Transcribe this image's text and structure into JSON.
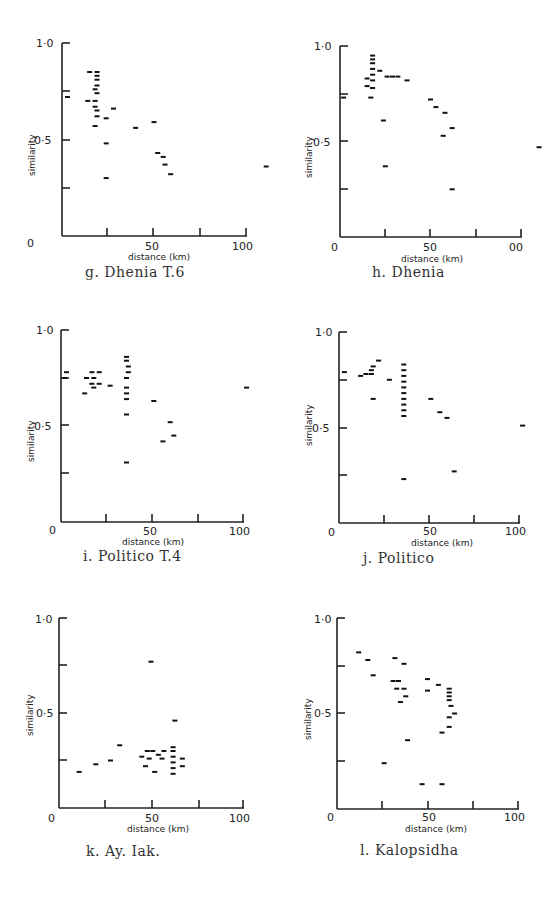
{
  "chart_data": [
    {
      "id": "g",
      "type": "scatter",
      "title": "g. Dhenia T.6",
      "xlabel": "distance (km)",
      "ylabel": "similarity",
      "xlim": [
        0,
        110
      ],
      "ylim": [
        0,
        1.0
      ],
      "x_ticks": [
        "0",
        "50",
        "100"
      ],
      "y_ticks": [
        "0",
        "0·5",
        "1·0"
      ],
      "points": [
        [
          3,
          0.72
        ],
        [
          15,
          0.85
        ],
        [
          19,
          0.85
        ],
        [
          19,
          0.83
        ],
        [
          19,
          0.81
        ],
        [
          19,
          0.78
        ],
        [
          18,
          0.76
        ],
        [
          19,
          0.74
        ],
        [
          14,
          0.7
        ],
        [
          18,
          0.7
        ],
        [
          18,
          0.67
        ],
        [
          19,
          0.65
        ],
        [
          19,
          0.62
        ],
        [
          18,
          0.57
        ],
        [
          24,
          0.61
        ],
        [
          28,
          0.66
        ],
        [
          24,
          0.48
        ],
        [
          24,
          0.3
        ],
        [
          40,
          0.56
        ],
        [
          50,
          0.59
        ],
        [
          52,
          0.43
        ],
        [
          55,
          0.41
        ],
        [
          56,
          0.37
        ],
        [
          59,
          0.32
        ],
        [
          111,
          0.36
        ]
      ]
    },
    {
      "id": "h",
      "type": "scatter",
      "title": "h. Dhenia",
      "xlabel": "distance (km)",
      "ylabel": "similarity",
      "xlim": [
        0,
        110
      ],
      "ylim": [
        0,
        1.0
      ],
      "x_ticks": [
        "0",
        "50",
        "00"
      ],
      "y_ticks": [
        "0",
        "0·5",
        "1·0"
      ],
      "points": [
        [
          2,
          0.73
        ],
        [
          18,
          0.95
        ],
        [
          18,
          0.93
        ],
        [
          18,
          0.91
        ],
        [
          18,
          0.88
        ],
        [
          22,
          0.87
        ],
        [
          18,
          0.85
        ],
        [
          15,
          0.83
        ],
        [
          18,
          0.82
        ],
        [
          15,
          0.79
        ],
        [
          18,
          0.78
        ],
        [
          17,
          0.73
        ],
        [
          26,
          0.84
        ],
        [
          29,
          0.84
        ],
        [
          32,
          0.84
        ],
        [
          37,
          0.82
        ],
        [
          24,
          0.61
        ],
        [
          25,
          0.37
        ],
        [
          50,
          0.72
        ],
        [
          53,
          0.68
        ],
        [
          58,
          0.65
        ],
        [
          62,
          0.57
        ],
        [
          57,
          0.53
        ],
        [
          62,
          0.25
        ],
        [
          110,
          0.47
        ]
      ]
    },
    {
      "id": "i",
      "type": "scatter",
      "title": "i. Politico T.4",
      "xlabel": "distance (km)",
      "ylabel": "similarity",
      "xlim": [
        0,
        105
      ],
      "ylim": [
        0,
        1.0
      ],
      "x_ticks": [
        "0",
        "50",
        "100"
      ],
      "y_ticks": [
        "0",
        "0·5",
        "1·0"
      ],
      "points": [
        [
          3,
          0.78
        ],
        [
          2,
          0.75
        ],
        [
          17,
          0.78
        ],
        [
          21,
          0.78
        ],
        [
          14,
          0.75
        ],
        [
          18,
          0.75
        ],
        [
          17,
          0.72
        ],
        [
          21,
          0.72
        ],
        [
          13,
          0.67
        ],
        [
          18,
          0.7
        ],
        [
          27,
          0.71
        ],
        [
          36,
          0.86
        ],
        [
          36,
          0.84
        ],
        [
          37,
          0.81
        ],
        [
          37,
          0.78
        ],
        [
          36,
          0.75
        ],
        [
          36,
          0.7
        ],
        [
          36,
          0.67
        ],
        [
          36,
          0.64
        ],
        [
          36,
          0.56
        ],
        [
          36,
          0.31
        ],
        [
          51,
          0.63
        ],
        [
          60,
          0.52
        ],
        [
          56,
          0.42
        ],
        [
          62,
          0.45
        ],
        [
          102,
          0.7
        ]
      ]
    },
    {
      "id": "j",
      "type": "scatter",
      "title": "j. Politico",
      "xlabel": "distance (km)",
      "ylabel": "similarity",
      "xlim": [
        0,
        105
      ],
      "ylim": [
        0,
        1.0
      ],
      "x_ticks": [
        "0",
        "50",
        "100"
      ],
      "y_ticks": [
        "0",
        "0·5",
        "1·0"
      ],
      "points": [
        [
          3,
          0.79
        ],
        [
          12,
          0.77
        ],
        [
          15,
          0.78
        ],
        [
          18,
          0.8
        ],
        [
          18,
          0.78
        ],
        [
          19,
          0.82
        ],
        [
          22,
          0.85
        ],
        [
          28,
          0.75
        ],
        [
          19,
          0.65
        ],
        [
          36,
          0.83
        ],
        [
          36,
          0.8
        ],
        [
          36,
          0.77
        ],
        [
          36,
          0.74
        ],
        [
          36,
          0.71
        ],
        [
          36,
          0.68
        ],
        [
          36,
          0.65
        ],
        [
          36,
          0.62
        ],
        [
          36,
          0.59
        ],
        [
          36,
          0.56
        ],
        [
          36,
          0.23
        ],
        [
          51,
          0.65
        ],
        [
          56,
          0.58
        ],
        [
          60,
          0.55
        ],
        [
          64,
          0.27
        ],
        [
          102,
          0.51
        ]
      ]
    },
    {
      "id": "k",
      "type": "scatter",
      "title": "k. Ay. Iak.",
      "xlabel": "distance (km)",
      "ylabel": "similarity",
      "xlim": [
        0,
        105
      ],
      "ylim": [
        0,
        1.0
      ],
      "x_ticks": [
        "0",
        "50",
        "100"
      ],
      "y_ticks": [
        "0",
        "0·5",
        "1·0"
      ],
      "points": [
        [
          11,
          0.19
        ],
        [
          20,
          0.23
        ],
        [
          28,
          0.25
        ],
        [
          33,
          0.33
        ],
        [
          45,
          0.27
        ],
        [
          48,
          0.3
        ],
        [
          49,
          0.26
        ],
        [
          47,
          0.22
        ],
        [
          50,
          0.77
        ],
        [
          51,
          0.3
        ],
        [
          52,
          0.19
        ],
        [
          54,
          0.28
        ],
        [
          56,
          0.26
        ],
        [
          57,
          0.3
        ],
        [
          62,
          0.32
        ],
        [
          62,
          0.3
        ],
        [
          62,
          0.27
        ],
        [
          62,
          0.24
        ],
        [
          62,
          0.21
        ],
        [
          62,
          0.18
        ],
        [
          63,
          0.46
        ],
        [
          67,
          0.26
        ],
        [
          67,
          0.22
        ]
      ]
    },
    {
      "id": "l",
      "type": "scatter",
      "title": "l. Kalopsidha",
      "xlabel": "distance (km)",
      "ylabel": "similarity",
      "xlim": [
        0,
        105
      ],
      "ylim": [
        0,
        1.0
      ],
      "x_ticks": [
        "0",
        "50",
        "100"
      ],
      "y_ticks": [
        "0",
        "0·5",
        "1·0"
      ],
      "points": [
        [
          12,
          0.82
        ],
        [
          17,
          0.78
        ],
        [
          20,
          0.7
        ],
        [
          26,
          0.24
        ],
        [
          32,
          0.79
        ],
        [
          37,
          0.76
        ],
        [
          31,
          0.67
        ],
        [
          34,
          0.67
        ],
        [
          33,
          0.63
        ],
        [
          37,
          0.63
        ],
        [
          38,
          0.59
        ],
        [
          35,
          0.56
        ],
        [
          39,
          0.36
        ],
        [
          50,
          0.68
        ],
        [
          50,
          0.62
        ],
        [
          56,
          0.65
        ],
        [
          47,
          0.13
        ],
        [
          58,
          0.13
        ],
        [
          62,
          0.63
        ],
        [
          62,
          0.61
        ],
        [
          62,
          0.59
        ],
        [
          62,
          0.57
        ],
        [
          63,
          0.54
        ],
        [
          65,
          0.5
        ],
        [
          62,
          0.48
        ],
        [
          62,
          0.43
        ],
        [
          58,
          0.4
        ]
      ]
    }
  ],
  "panels": [
    {
      "caption": "g.  Dhenia T.6",
      "y_top": "1·0",
      "y_mid": "0·5",
      "origin": "0",
      "x_mid": "50",
      "x_end": "100",
      "xlabel": "distance (km)",
      "ylabel": "similarity"
    },
    {
      "caption": "h.  Dhenia",
      "y_top": "1·0",
      "y_mid": "0·5",
      "origin": "0",
      "x_mid": "50",
      "x_end": "00",
      "xlabel": "distance (km)",
      "ylabel": "similarity"
    },
    {
      "caption": "i.  Politico T.4",
      "y_top": "1·0",
      "y_mid": "0·5",
      "origin": "0",
      "x_mid": "50",
      "x_end": "100",
      "xlabel": "distance (km)",
      "ylabel": "similarity"
    },
    {
      "caption": "j.  Politico",
      "y_top": "1·0",
      "y_mid": "0·5",
      "origin": "0",
      "x_mid": "50",
      "x_end": "100",
      "xlabel": "distance (km)",
      "ylabel": "similarity"
    },
    {
      "caption": "k.  Ay. Iak.",
      "y_top": "1·0",
      "y_mid": "0·5",
      "origin": "0",
      "x_mid": "50",
      "x_end": "100",
      "xlabel": "distance (km)",
      "ylabel": "similarity"
    },
    {
      "caption": "l.  Kalopsidha",
      "y_top": "1·0",
      "y_mid": "0·5",
      "origin": "0",
      "x_mid": "50",
      "x_end": "100",
      "xlabel": "distance (km)",
      "ylabel": "similarity"
    }
  ]
}
